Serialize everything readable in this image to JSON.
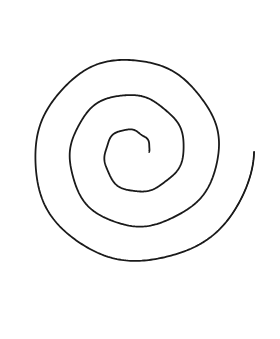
{
  "canvas": {
    "width": 280,
    "height": 339,
    "background_color": "#ffffff",
    "title": "Hand-drawn spiral"
  },
  "drawing": {
    "name": "spiral",
    "type": "archimedean-spiral",
    "stroke_color": "#1a1a1a",
    "stroke_width_px": 1.8,
    "turns": 3,
    "center": {
      "x": 135,
      "y": 152
    },
    "inner_tip": {
      "x": 132,
      "y": 152,
      "cap": "blunt"
    },
    "outer_tip": {
      "x": 263,
      "y": 28,
      "cap": "tapered-point"
    },
    "winding_direction": "counterclockwise-outward",
    "bounds": {
      "left": 17,
      "right": 265,
      "top": 23,
      "bottom": 318
    },
    "crossings_horizontal_y175_left_x": [
      17,
      49,
      73,
      100
    ],
    "crossings_horizontal_y175_right_x": [
      148,
      173,
      203,
      262
    ],
    "crossings_vertical_x135_above_y": [
      25,
      72,
      110,
      152
    ],
    "crossings_vertical_x135_below_y": [
      202,
      243,
      282,
      317
    ],
    "path_d": "M 132.5 152.2 C 139.5 150.8 146.5 152.2 151.6 155.6 C 158.0 159.8 161.6 166.4 162.4 173.6 C 163.4 182.8 160.2 191.6 154.2 198.0 C 147.4 205.2 137.6 209.0 127.8 208.4 C 116.6 207.8 106.2 202.2 99.6 193.4 C 92.4 183.8 89.6 171.4 91.8 159.6 C 94.2 146.6 101.8 135.0 112.6 127.4 C 124.2 119.2 139.0 116.0 152.8 118.6 C 167.6 121.4 180.6 130.4 188.8 143.0 C 197.6 156.4 200.6 173.0 197.4 188.6 C 194.0 205.4 184.0 220.4 169.9 230.2 C 154.8 240.8 135.6 244.6 117.4 241.2 C 98.0 237.6 80.6 226.2 69.4 210.0 C 57.6 192.8 52.8 171.2 56.0 150.6 C 59.4 129.0 71.0 109.2 88.0 95.6 C 105.8 81.2 128.8 74.4 151.4 76.6 C 175.0 78.8 197.0 90.2 212.2 108.2 C 228.0 126.8 236.2 151.4 235.0 175.8 C 233.8 201.2 222.6 225.6 204.4 243.4 C 185.4 262.0 159.2 272.6 132.4 272.4 C 104.6 272.2 77.6 260.8 58.4 241.2 C 38.4 220.8 27.4 192.4 28.2 164.0 C 29.0 134.6 42.0 106.2 63.6 86.2 C 86.0 65.4 117.0 54.6 147.8 56.2 C 179.6 57.8 210.2 71.8 231.2 95.4 C 253.0 119.8 264.4 153.0 262.4 185.6 C 260.4 219.0 245.0 250.8 220.4 273.0 C 195.0 295.8 160.4 308.2 126.2 307.0 C 91.2 305.8 57.2 290.6 33.4 265.2 C 8.8 239.0 -3.2 202.6 1.0 167.0",
    "description": "A continuous single-line spiral of roughly three turns, hand-drawn with a thin black pen on plain white paper. It begins with a small blunt hook at the center and unwinds outward, ending in a long tapering point at the upper right."
  }
}
